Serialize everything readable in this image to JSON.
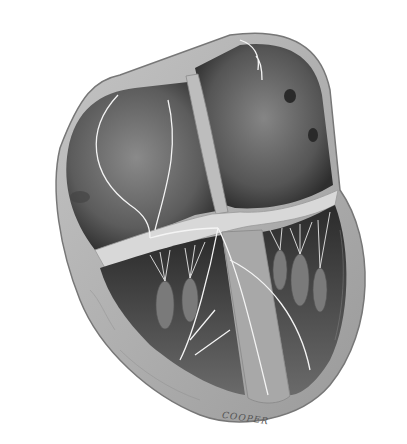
{
  "image": {
    "subject": "heart cross-section illustration",
    "style": "grayscale",
    "signature": "COOPER"
  },
  "colors": {
    "background": "#ffffff",
    "wall": "#a9a9a9",
    "wall_light": "#d6d6d6",
    "chamber": "#6e6e6e",
    "chamber_dark": "#3f3f3f",
    "fiber": "#f2f2f2"
  }
}
